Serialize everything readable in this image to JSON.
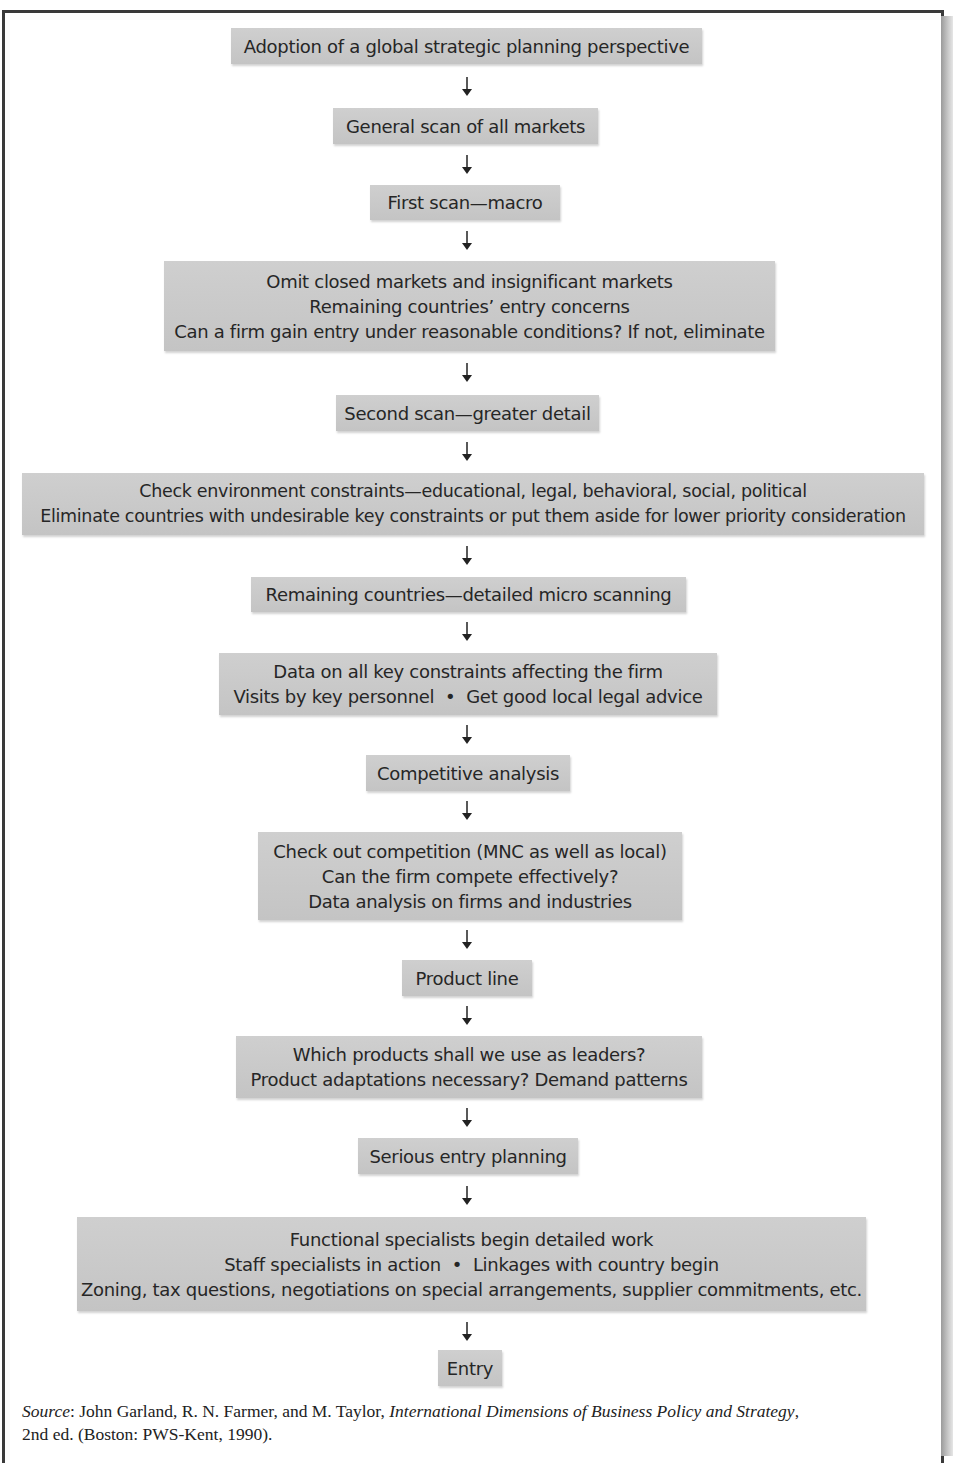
{
  "figure": {
    "steps": [
      {
        "lines": [
          "Adoption of a global strategic planning perspective"
        ]
      },
      {
        "lines": [
          "General scan of all markets"
        ]
      },
      {
        "lines": [
          "First scan—macro"
        ]
      },
      {
        "lines": [
          "Omit closed markets and insignificant markets",
          "Remaining countries’ entry concerns",
          "Can a firm gain entry under reasonable conditions? If not, eliminate"
        ]
      },
      {
        "lines": [
          "Second scan—greater detail"
        ]
      },
      {
        "lines": [
          "Check environment constraints—educational, legal, behavioral, social, political",
          "Eliminate countries with undesirable key constraints or put them aside for lower priority consideration"
        ]
      },
      {
        "lines": [
          "Remaining countries—detailed micro scanning"
        ]
      },
      {
        "lines": [
          "Data on all key constraints affecting the firm",
          "Visits by key personnel  •  Get good local legal advice"
        ]
      },
      {
        "lines": [
          "Competitive analysis"
        ]
      },
      {
        "lines": [
          "Check out competition (MNC as well as local)",
          "Can the firm compete effectively?",
          "Data analysis on firms and industries"
        ]
      },
      {
        "lines": [
          "Product line"
        ]
      },
      {
        "lines": [
          "Which products shall we use as leaders?",
          "Product adaptations necessary? Demand patterns"
        ]
      },
      {
        "lines": [
          "Serious entry planning"
        ]
      },
      {
        "lines": [
          "Functional specialists begin detailed work",
          "Staff specialists in action  •  Linkages with country begin",
          "Zoning, tax questions, negotiations on special arrangements, supplier commitments, etc."
        ]
      },
      {
        "lines": [
          "Entry"
        ]
      }
    ],
    "arrow_icon": "down-arrow-icon",
    "colors": {
      "box_fill": "#c9c9c9",
      "text": "#262626",
      "border": "#3a3a3a"
    }
  },
  "source": {
    "label": "Source",
    "authors": ": John Garland, R. N. Farmer, and M. Taylor, ",
    "title": "International Dimensions of Business Policy and Strategy",
    "tail": ",",
    "line2": "2nd ed. (Boston: PWS-Kent, 1990)."
  }
}
